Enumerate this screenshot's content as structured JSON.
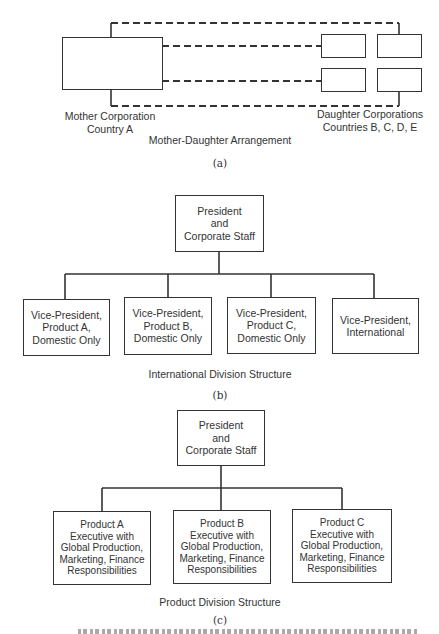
{
  "diagram_a": {
    "mother_label": "Mother Corporation\nCountry A",
    "daughter_label": "Daughter Corporations\nCountries B, C, D, E",
    "title": "Mother-Daughter Arrangement",
    "tag": "(a)"
  },
  "diagram_b": {
    "top_box": "President\nand\nCorporate Staff",
    "children": [
      "Vice-President,\nProduct A,\nDomestic Only",
      "Vice-President,\nProduct B,\nDomestic Only",
      "Vice-President,\nProduct C,\nDomestic Only",
      "Vice-President,\nInternational"
    ],
    "title": "International Division Structure",
    "tag": "(b)"
  },
  "diagram_c": {
    "top_box": "President\nand\nCorporate Staff",
    "children": [
      "Product A\nExecutive with\nGlobal Production,\nMarketing, Finance\nResponsibilities",
      "Product B\nExecutive with\nGlobal Production,\nMarketing, Finance\nResponsibilities",
      "Product C\nExecutive with\nGlobal Production,\nMarketing, Finance\nResponsibilities"
    ],
    "title": "Product Division Structure",
    "tag": "(c)"
  }
}
